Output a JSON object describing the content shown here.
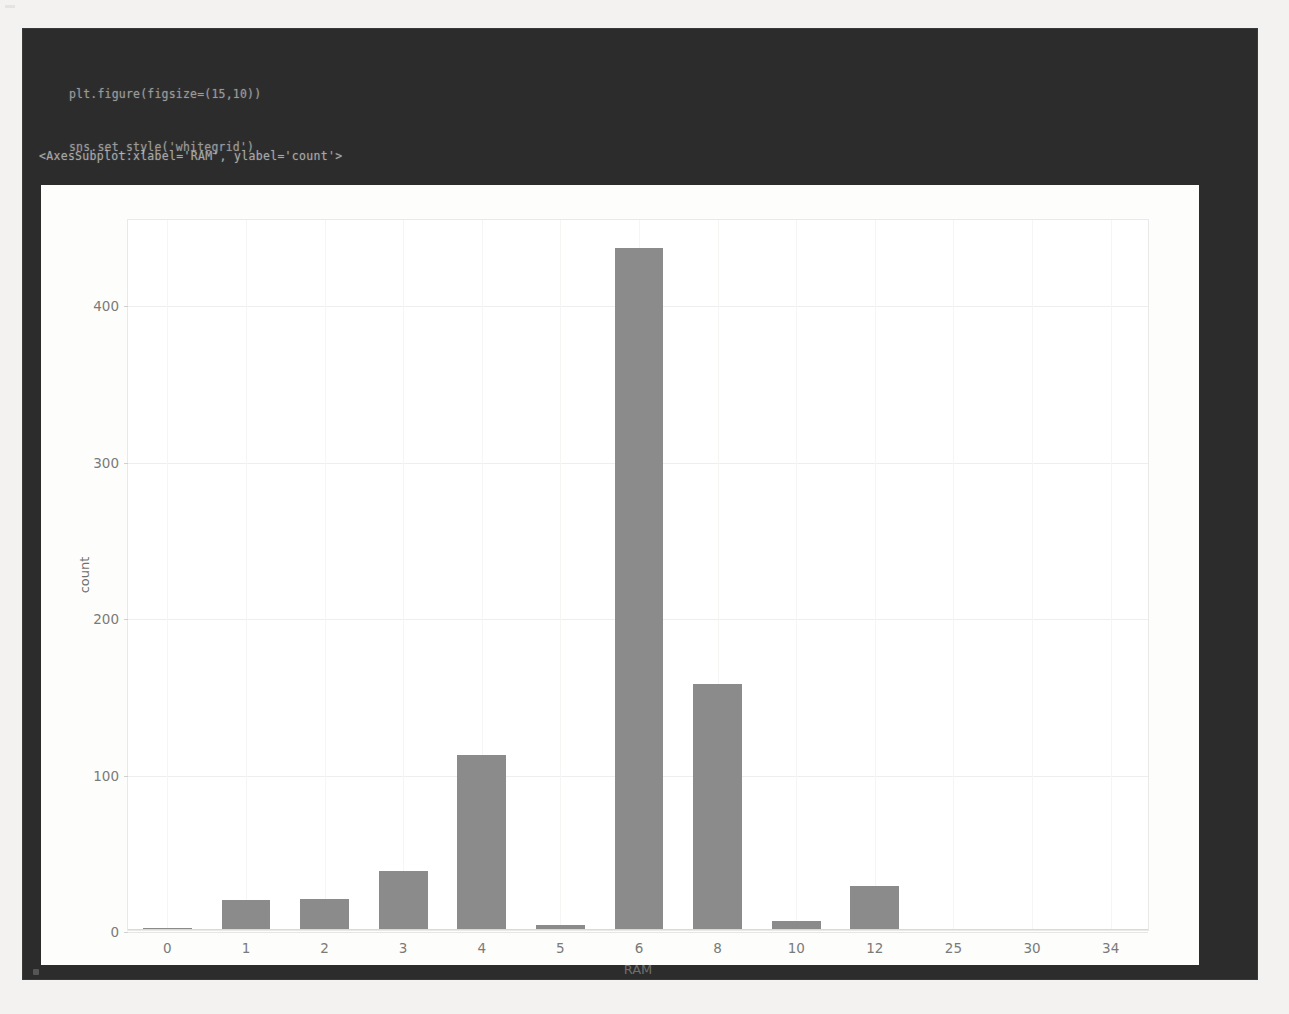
{
  "notebook": {
    "code_lines": [
      "plt.figure(figsize=(15,10))",
      "sns.set_style('whitegrid')",
      "sns.countplot(x='RAM',data=df)"
    ],
    "output_repr": "<AxesSubplot:xlabel='RAM', ylabel='count'>",
    "cell_background": "#2c2c2c",
    "code_color": "#b9b9b9"
  },
  "chart_data": {
    "type": "bar",
    "title": "",
    "xlabel": "RAM",
    "ylabel": "count",
    "categories": [
      "0",
      "1",
      "2",
      "3",
      "4",
      "5",
      "6",
      "8",
      "10",
      "12",
      "25",
      "30",
      "34"
    ],
    "values": [
      1,
      19,
      20,
      38,
      112,
      3,
      436,
      157,
      6,
      28,
      0,
      0,
      0
    ],
    "ylim": [
      0,
      455
    ],
    "yticks": [
      0,
      100,
      200,
      300,
      400
    ],
    "ytick_labels": [
      "0",
      "100",
      "200",
      "300",
      "400"
    ],
    "grid": true,
    "grid_axis": "y",
    "legend": null,
    "style": "whitegrid",
    "bar_color": "#8b8b8b",
    "axes_facecolor": "#ffffff",
    "figure_facecolor": "#fdfdfc",
    "gridline_color": "#eeeeec"
  }
}
